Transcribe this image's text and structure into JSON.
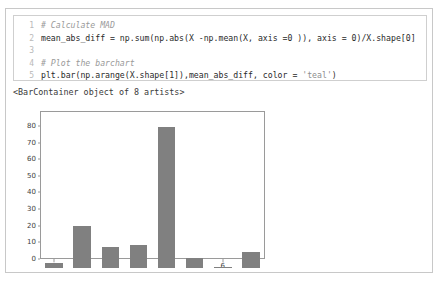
{
  "cell": {
    "code_lines": [
      {
        "num": "1",
        "segments": [
          {
            "text": "# Calculate MAD",
            "style": "cmt"
          }
        ]
      },
      {
        "num": "2",
        "segments": [
          {
            "text": "mean_abs_diff = np.sum(np.abs(X -np.mean(X, axis =0 )), axis = 0)/X.shape[0]",
            "style": "code-text"
          }
        ]
      },
      {
        "num": "3",
        "segments": [
          {
            "text": "",
            "style": "code-text"
          }
        ]
      },
      {
        "num": "4",
        "segments": [
          {
            "text": "# Plot the barchart",
            "style": "cmt"
          }
        ]
      },
      {
        "num": "5",
        "segments": [
          {
            "text": "plt.bar(np.arange(X.shape[1]),mean_abs_diff, color = ",
            "style": "code-text"
          },
          {
            "text": "'teal'",
            "style": "str"
          },
          {
            "text": ")",
            "style": "code-text"
          }
        ]
      }
    ],
    "output_text": "<BarContainer object of 8 artists>"
  },
  "chart_data": {
    "type": "bar",
    "title": "",
    "xlabel": "",
    "ylabel": "",
    "categories": [
      "0",
      "1",
      "2",
      "3",
      "4",
      "5",
      "6",
      "7"
    ],
    "values": [
      3,
      25,
      12.5,
      14,
      85,
      6,
      0.5,
      9.5
    ],
    "ylim": [
      0,
      89
    ],
    "yticks": [
      0,
      10,
      20,
      30,
      40,
      50,
      60,
      70,
      80
    ],
    "ytick_labels": [
      "0",
      "10",
      "20",
      "30",
      "40",
      "50",
      "60",
      "70",
      "80"
    ],
    "xticks": [
      0,
      1,
      2,
      3,
      4,
      5,
      6,
      7
    ],
    "grid": false,
    "legend": false,
    "bar_color": "#808080",
    "axis_color": "#9a9a9a",
    "background": "#ffffff"
  }
}
